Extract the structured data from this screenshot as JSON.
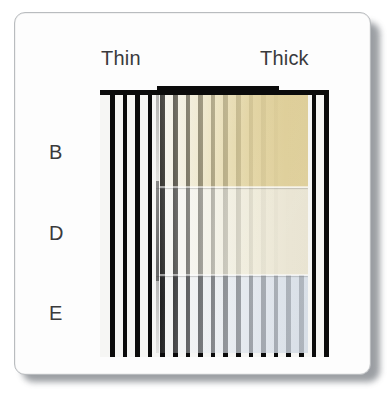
{
  "figure": {
    "background_color": "#ffffff",
    "card_color": "#fdfdfd",
    "card_border_color": "#b9bcbf",
    "shadow_color": "#8a8e93"
  },
  "column_headers": [
    {
      "id": "thin",
      "label": "Thin"
    },
    {
      "id": "thick",
      "label": "Thick"
    }
  ],
  "row_headers": [
    {
      "id": "b",
      "label": "B"
    },
    {
      "id": "d",
      "label": "D"
    },
    {
      "id": "e",
      "label": "E"
    }
  ],
  "mesh": {
    "name": "black-grid-backing-plate",
    "cell_color": "#f6f6f4",
    "line_color": "#0b0b0b",
    "pitch_px": 12.6
  },
  "specimen": {
    "name": "translucent-sample-slab",
    "gradient_direction": "thin-to-thick",
    "bands": [
      {
        "id": "b",
        "label": "B",
        "thin_color": "#ece4c4",
        "thick_color": "#ddcd97",
        "appearance": "amber / tan, opaque at thick end"
      },
      {
        "id": "d",
        "label": "D",
        "thin_color": "#f6f6f3",
        "thick_color": "#e8e4d1",
        "appearance": "pale cream, opaque at thick end"
      },
      {
        "id": "e",
        "label": "E",
        "thin_color": "#eef1f5",
        "thick_color": "#d2dbe5",
        "appearance": "cool blue-grey, stays translucent"
      }
    ]
  }
}
